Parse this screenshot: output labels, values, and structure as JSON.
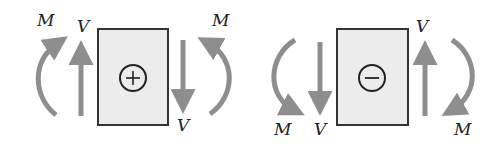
{
  "colors": {
    "arrow": "#8e8e8e",
    "box_fill": "#ececec",
    "box_stroke": "#333333",
    "sign_stroke": "#222222",
    "label": "#222222"
  },
  "panels": [
    {
      "id": "positive",
      "sign": "+",
      "sign_name": "plus",
      "box": {
        "x": 98,
        "y": 29,
        "w": 70,
        "h": 96
      },
      "circle": {
        "cx": 133,
        "cy": 78,
        "r": 13
      },
      "labels": [
        {
          "text": "M",
          "x": 37,
          "y": 12,
          "role": "left-moment"
        },
        {
          "text": "V",
          "x": 77,
          "y": 18,
          "role": "left-shear"
        },
        {
          "text": "M",
          "x": 212,
          "y": 12,
          "role": "right-moment"
        },
        {
          "text": "V",
          "x": 177,
          "y": 117,
          "role": "right-shear"
        }
      ]
    },
    {
      "id": "negative",
      "sign": "−",
      "sign_name": "minus",
      "box": {
        "x": 337,
        "y": 29,
        "w": 71,
        "h": 96
      },
      "circle": {
        "cx": 372,
        "cy": 78,
        "r": 13
      },
      "labels": [
        {
          "text": "M",
          "x": 274,
          "y": 121,
          "role": "left-moment"
        },
        {
          "text": "V",
          "x": 314,
          "y": 121,
          "role": "left-shear"
        },
        {
          "text": "V",
          "x": 416,
          "y": 18,
          "role": "right-shear"
        },
        {
          "text": "M",
          "x": 454,
          "y": 121,
          "role": "right-moment"
        }
      ]
    }
  ]
}
